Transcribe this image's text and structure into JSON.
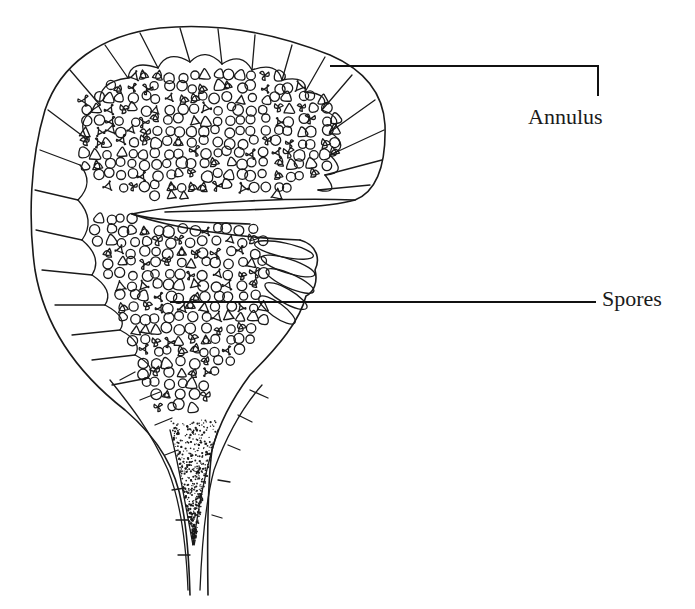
{
  "diagram": {
    "ink_color": "#1a1a1a",
    "background": "#ffffff",
    "labels": [
      {
        "id": "annulus",
        "text": "Annulus",
        "x": 528,
        "y": 104
      },
      {
        "id": "spores",
        "text": "Spores",
        "x": 602,
        "y": 286
      }
    ],
    "leaders": [
      {
        "id": "annulus-leader",
        "points": [
          [
            330,
            66
          ],
          [
            598,
            66
          ],
          [
            598,
            96
          ]
        ]
      },
      {
        "id": "spores-leader",
        "points": [
          [
            170,
            302
          ],
          [
            596,
            302
          ]
        ]
      }
    ]
  }
}
